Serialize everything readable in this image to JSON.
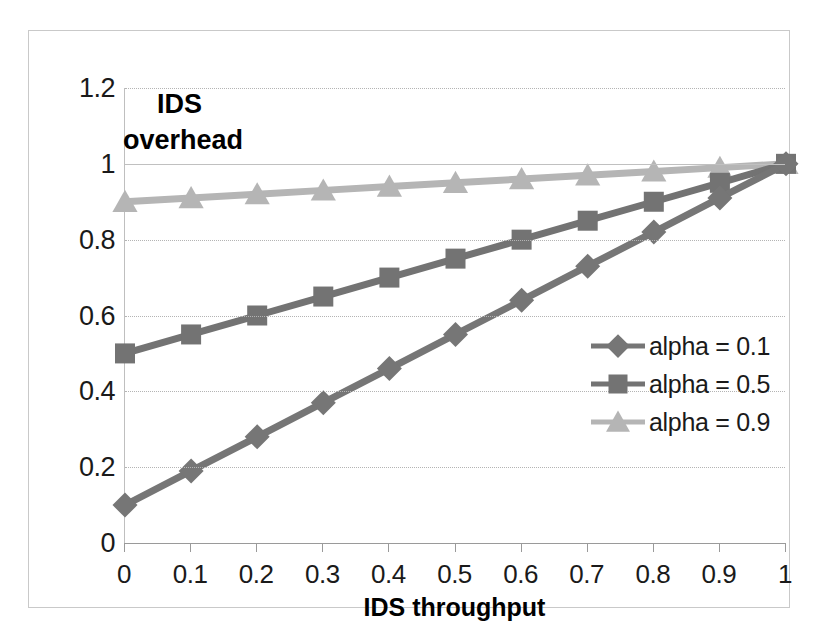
{
  "chart_data": {
    "type": "line",
    "title": "",
    "xlabel": "IDS throughput",
    "ylabel": "IDS overhead",
    "ylabel_line1": "IDS",
    "ylabel_line2": "overhead",
    "x": [
      0,
      0.1,
      0.2,
      0.3,
      0.4,
      0.5,
      0.6,
      0.7,
      0.8,
      0.9,
      1
    ],
    "xtick_labels": [
      "0",
      "0.1",
      "0.2",
      "0.3",
      "0.4",
      "0.5",
      "0.6",
      "0.7",
      "0.8",
      "0.9",
      "1"
    ],
    "ytick_labels": [
      "0",
      "0.2",
      "0.4",
      "0.6",
      "0.8",
      "1",
      "1.2"
    ],
    "yticks": [
      0,
      0.2,
      0.4,
      0.6,
      0.8,
      1,
      1.2
    ],
    "xlim": [
      0,
      1
    ],
    "ylim": [
      0,
      1.2
    ],
    "grid": true,
    "legend_position": "center-right",
    "series": [
      {
        "name": "alpha = 0.1",
        "marker": "diamond",
        "color": "#767676",
        "values": [
          0.1,
          0.19,
          0.28,
          0.37,
          0.46,
          0.55,
          0.64,
          0.73,
          0.82,
          0.91,
          1.0
        ]
      },
      {
        "name": "alpha = 0.5",
        "marker": "square",
        "color": "#737373",
        "values": [
          0.5,
          0.55,
          0.6,
          0.65,
          0.7,
          0.75,
          0.8,
          0.85,
          0.9,
          0.95,
          1.0
        ]
      },
      {
        "name": "alpha = 0.9",
        "marker": "triangle",
        "color": "#b5b5b5",
        "values": [
          0.9,
          0.91,
          0.92,
          0.93,
          0.94,
          0.95,
          0.96,
          0.97,
          0.98,
          0.99,
          1.0
        ]
      }
    ]
  },
  "legend": {
    "items": [
      {
        "label": "alpha = 0.1",
        "marker": "diamond",
        "color": "#767676"
      },
      {
        "label": "alpha = 0.5",
        "marker": "square",
        "color": "#737373"
      },
      {
        "label": "alpha = 0.9",
        "marker": "triangle",
        "color": "#b5b5b5"
      }
    ]
  },
  "axes": {
    "x_title": "IDS throughput",
    "y_title_line1": "IDS",
    "y_title_line2": "overhead"
  }
}
